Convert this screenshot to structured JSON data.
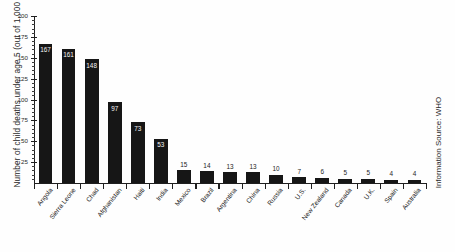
{
  "chart_data": {
    "type": "bar",
    "title": "",
    "xlabel": "",
    "ylabel": "Number of child deaths under age 5 (out of 1,000 live births)",
    "ylim": [
      0,
      200
    ],
    "ytick_values": [
      25,
      50,
      75,
      100,
      125,
      150,
      175,
      200
    ],
    "ytick_labels": [
      "25",
      "50",
      "75",
      "100",
      "125",
      "150",
      "175",
      "200"
    ],
    "grid": false,
    "legend": "none",
    "categories": [
      "Angola",
      "Sierra Leone",
      "Chad",
      "Afghanistan",
      "Haiti",
      "India",
      "Mexico",
      "Brazil",
      "Argentina",
      "China",
      "Russia",
      "U.S.",
      "New Zealand",
      "Canada",
      "U.K.",
      "Spain",
      "Australia"
    ],
    "values": [
      167,
      161,
      148,
      97,
      73,
      53,
      15,
      14,
      13,
      13,
      10,
      7,
      6,
      5,
      5,
      4,
      4
    ],
    "value_labels": [
      "167",
      "161",
      "148",
      "97",
      "73",
      "53",
      "15",
      "14",
      "13",
      "13",
      "10",
      "7",
      "6",
      "5",
      "5",
      "4",
      "4"
    ],
    "bar_color": "#161616",
    "annotations": [
      "Information Source: WHO"
    ]
  },
  "axis": {
    "y_title": "Number of child deaths under age 5 (out of 1,000 live births)"
  },
  "footer": {
    "source": "Information Source: WHO"
  }
}
